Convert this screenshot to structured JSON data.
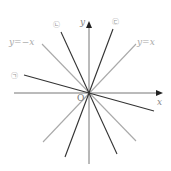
{
  "diagram": {
    "type": "coordinate-plane-lines-through-origin",
    "axes": {
      "x_label": "x",
      "y_label": "y",
      "origin_label": "O"
    },
    "reference_lines": [
      {
        "label": "y=x",
        "slope": 1,
        "color": "#a8a8a8"
      },
      {
        "label": "y=−x",
        "slope": -1,
        "color": "#a8a8a8"
      }
    ],
    "marked_lines": [
      {
        "label": "㉠",
        "description": "shallow negative slope line",
        "color": "#333333"
      },
      {
        "label": "㉡",
        "description": "steep negative slope line",
        "color": "#333333"
      },
      {
        "label": "㉢",
        "description": "steep positive slope line",
        "color": "#333333"
      }
    ],
    "colors": {
      "axis": "#777777",
      "reference": "#a8a8a8",
      "marked": "#333333",
      "label_text": "#999999"
    }
  }
}
